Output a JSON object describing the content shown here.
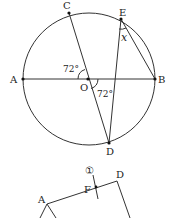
{
  "figure1": {
    "circle": {
      "cx": 89,
      "cy": 79,
      "r": 66
    },
    "points": {
      "A": {
        "label": "A",
        "x": 23,
        "y": 79
      },
      "B": {
        "label": "B",
        "x": 155,
        "y": 79
      },
      "O": {
        "label": "O",
        "x": 88,
        "y": 79
      },
      "C": {
        "label": "C",
        "x": 69,
        "y": 13
      },
      "E": {
        "label": "E",
        "x": 121,
        "y": 19
      },
      "D": {
        "label": "D",
        "x": 109,
        "y": 143
      }
    },
    "angles": {
      "angle_AOC": "72°",
      "angle_BOD": "72°",
      "angle_x": "x"
    }
  },
  "figure2": {
    "points": {
      "A": {
        "label": "A",
        "x": 47,
        "y": 204
      },
      "F": {
        "label": "F",
        "x": 96,
        "y": 187
      },
      "D": {
        "label": "D",
        "x": 117,
        "y": 181
      }
    },
    "marker": "①"
  }
}
